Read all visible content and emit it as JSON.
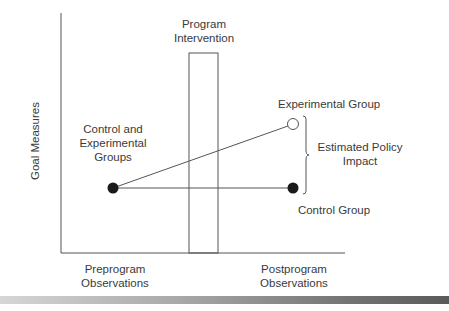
{
  "diagram": {
    "type": "quasi-experimental design diagram",
    "y_axis_label": "Goal Measures",
    "x_labels": {
      "pre": "Preprogram\nObservations",
      "post": "Postprogram\nObservations"
    },
    "intervention_label_line1": "Program",
    "intervention_label_line2": "Intervention",
    "start_label_line1": "Control and",
    "start_label_line2": "Experimental",
    "start_label_line3": "Groups",
    "experimental_label": "Experimental Group",
    "control_label": "Control Group",
    "impact_label_line1": "Estimated Policy",
    "impact_label_line2": "Impact",
    "pre_label_line1": "Preprogram",
    "pre_label_line2": "Observations",
    "post_label_line1": "Postprogram",
    "post_label_line2": "Observations",
    "colors": {
      "line": "#4a4a4a",
      "point_fill": "#1a1a1a",
      "hollow_point_fill": "#ffffff"
    }
  }
}
